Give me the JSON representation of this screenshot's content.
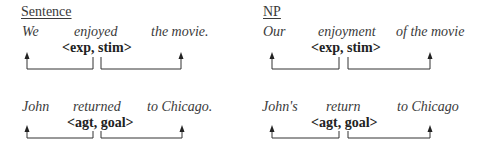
{
  "columns": [
    {
      "heading": "Sentence",
      "examples": [
        {
          "words": [
            "We",
            "enjoyed",
            "the movie."
          ],
          "roles": "<exp, stim>"
        },
        {
          "words": [
            "John",
            "returned",
            "to Chicago."
          ],
          "roles": "<agt, goal>"
        }
      ]
    },
    {
      "heading": "NP",
      "examples": [
        {
          "words": [
            "Our",
            "enjoyment",
            "of the movie"
          ],
          "roles": "<exp, stim>"
        },
        {
          "words": [
            "John's",
            "return",
            "to Chicago"
          ],
          "roles": "<agt, goal>"
        }
      ]
    }
  ]
}
